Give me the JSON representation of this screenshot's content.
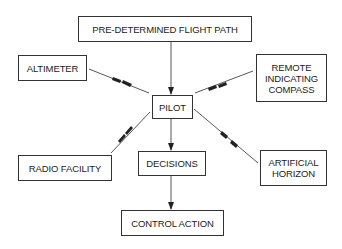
{
  "diagram": {
    "nodes": [
      {
        "id": "path",
        "label": "PRE-DETERMINED FLIGHT PATH"
      },
      {
        "id": "altimeter",
        "label": "ALTIMETER"
      },
      {
        "id": "compass",
        "label": "REMOTE INDICATING COMPASS"
      },
      {
        "id": "pilot",
        "label": "PILOT"
      },
      {
        "id": "radio",
        "label": "RADIO FACILITY"
      },
      {
        "id": "decisions",
        "label": "DECISIONS"
      },
      {
        "id": "horizon",
        "label": "ARTIFICIAL HORIZON"
      },
      {
        "id": "control",
        "label": "CONTROL ACTION"
      }
    ],
    "edges": [
      {
        "from": "path",
        "to": "pilot"
      },
      {
        "from": "altimeter",
        "to": "pilot",
        "style": "double-arrowhead"
      },
      {
        "from": "compass",
        "to": "pilot",
        "style": "double-arrowhead"
      },
      {
        "from": "radio",
        "to": "pilot",
        "style": "double-arrowhead"
      },
      {
        "from": "horizon",
        "to": "pilot",
        "style": "double-arrowhead"
      },
      {
        "from": "pilot",
        "to": "decisions"
      },
      {
        "from": "decisions",
        "to": "control"
      }
    ],
    "line_color": "#333333"
  }
}
